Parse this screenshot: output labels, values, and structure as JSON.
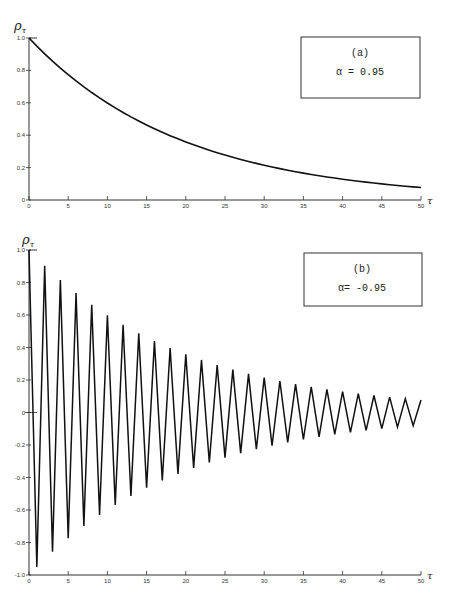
{
  "chart_data": [
    {
      "type": "line",
      "panel": "(a)",
      "title": "",
      "annotation": {
        "label": "(a)",
        "param": "α = 0.95"
      },
      "xlabel": "τ",
      "ylabel": "ρ_τ",
      "xlim": [
        0,
        50
      ],
      "ylim": [
        0,
        1.0
      ],
      "xticks": [
        0,
        5,
        10,
        15,
        20,
        25,
        30,
        35,
        40,
        45,
        50
      ],
      "yticks": [
        0,
        0.2,
        0.4,
        0.6,
        0.8,
        1.0
      ],
      "ytick_labels": [
        "0",
        "0.2",
        "0.4",
        "0.6",
        "0.8",
        "1.0"
      ],
      "grid": false,
      "legend": "box top-right",
      "series": [
        {
          "name": "α = 0.95",
          "x": [
            0,
            1,
            2,
            3,
            4,
            5,
            6,
            7,
            8,
            9,
            10,
            11,
            12,
            13,
            14,
            15,
            16,
            17,
            18,
            19,
            20,
            21,
            22,
            23,
            24,
            25,
            26,
            27,
            28,
            29,
            30,
            31,
            32,
            33,
            34,
            35,
            36,
            37,
            38,
            39,
            40,
            41,
            42,
            43,
            44,
            45,
            46,
            47,
            48,
            49,
            50
          ],
          "values": [
            1.0,
            0.95,
            0.9025,
            0.8574,
            0.8145,
            0.7738,
            0.7351,
            0.6983,
            0.6634,
            0.6302,
            0.5987,
            0.5688,
            0.5404,
            0.5133,
            0.4877,
            0.4633,
            0.4401,
            0.4181,
            0.3972,
            0.3774,
            0.3585,
            0.3406,
            0.3235,
            0.3074,
            0.292,
            0.2774,
            0.2635,
            0.2503,
            0.2378,
            0.2259,
            0.2146,
            0.2039,
            0.1937,
            0.184,
            0.1748,
            0.1661,
            0.1578,
            0.1499,
            0.1424,
            0.1353,
            0.1285,
            0.1221,
            0.116,
            0.1102,
            0.1047,
            0.0994,
            0.0945,
            0.0897,
            0.0853,
            0.081,
            0.0769
          ]
        }
      ]
    },
    {
      "type": "line",
      "panel": "(b)",
      "title": "",
      "annotation": {
        "label": "(b)",
        "param": "α= -0.95"
      },
      "xlabel": "τ",
      "ylabel": "ρ_τ",
      "xlim": [
        0,
        50
      ],
      "ylim": [
        -1.0,
        1.0
      ],
      "xticks": [
        0,
        5,
        10,
        15,
        20,
        25,
        30,
        35,
        40,
        45,
        50
      ],
      "yticks": [
        -1.0,
        -0.8,
        -0.6,
        -0.4,
        -0.2,
        0,
        0.2,
        0.4,
        0.6,
        0.8,
        1.0
      ],
      "ytick_labels": [
        "-1.0",
        "-0.8",
        "-0.6",
        "-0.4",
        "-0.2",
        "0",
        "0.2",
        "0.4",
        "0.6",
        "0.8",
        "1.0"
      ],
      "grid": false,
      "legend": "box top-right",
      "series": [
        {
          "name": "α = -0.95",
          "x": [
            0,
            1,
            2,
            3,
            4,
            5,
            6,
            7,
            8,
            9,
            10,
            11,
            12,
            13,
            14,
            15,
            16,
            17,
            18,
            19,
            20,
            21,
            22,
            23,
            24,
            25,
            26,
            27,
            28,
            29,
            30,
            31,
            32,
            33,
            34,
            35,
            36,
            37,
            38,
            39,
            40,
            41,
            42,
            43,
            44,
            45,
            46,
            47,
            48,
            49,
            50
          ],
          "values": [
            1.0,
            -0.95,
            0.9025,
            -0.8574,
            0.8145,
            -0.7738,
            0.7351,
            -0.6983,
            0.6634,
            -0.6302,
            0.5987,
            -0.5688,
            0.5404,
            -0.5133,
            0.4877,
            -0.4633,
            0.4401,
            -0.4181,
            0.3972,
            -0.3774,
            0.3585,
            -0.3406,
            0.3235,
            -0.3074,
            0.292,
            -0.2774,
            0.2635,
            -0.2503,
            0.2378,
            -0.2259,
            0.2146,
            -0.2039,
            0.1937,
            -0.184,
            0.1748,
            -0.1661,
            0.1578,
            -0.1499,
            0.1424,
            -0.1353,
            0.1285,
            -0.1221,
            0.116,
            -0.1102,
            0.1047,
            -0.0994,
            0.0945,
            -0.0897,
            0.0853,
            -0.081,
            0.0769
          ]
        }
      ]
    }
  ],
  "labels": {
    "ylabel_rho": "ρ",
    "ylabel_sub": "τ",
    "xlabel_tau": "τ",
    "panel_a": "(a)",
    "panel_a_param": "α = 0.95",
    "panel_b": "(b)",
    "panel_b_param": "α= -0.95"
  }
}
